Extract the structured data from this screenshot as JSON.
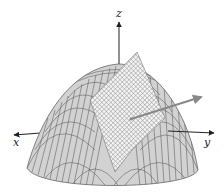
{
  "figure": {
    "axes": {
      "x_label": "x",
      "y_label": "y",
      "z_label": "z"
    },
    "colors": {
      "surface_fill": "#d2d2d2",
      "surface_lines": "#555555",
      "plane_fill": "#f2f2f2",
      "plane_grid": "#8a8a8a",
      "normal_vector": "#888888",
      "axis": "#222222"
    }
  }
}
